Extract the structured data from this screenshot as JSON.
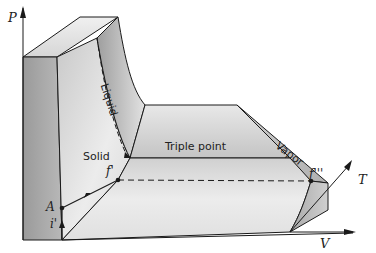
{
  "figure": {
    "axes": {
      "p_label": "P",
      "t_label": "T",
      "v_label": "V"
    },
    "regions": {
      "solid": "Solid",
      "liquid": "Liquid",
      "vapor": "Vapor",
      "triple_point": "Triple point"
    },
    "points": {
      "a": "A",
      "i_prime": "i'",
      "f_prime": "f'",
      "f_triple_prime": "f'''"
    },
    "colors": {
      "line": "#1a1a1a",
      "face_dark": "#8c8c8c",
      "face_mid": "#bdbdbd",
      "face_light": "#e6e6e6",
      "background": "#ffffff"
    }
  }
}
